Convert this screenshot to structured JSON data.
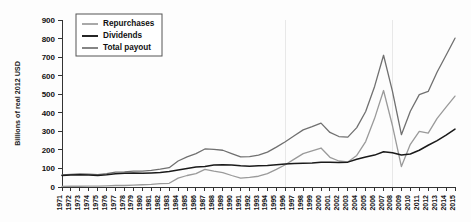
{
  "chart_data": {
    "type": "line",
    "title": "",
    "xlabel": "",
    "ylabel": "Billions of real 2012 USD",
    "ylim": [
      0,
      900
    ],
    "ytick_values": [
      0,
      100,
      200,
      300,
      400,
      500,
      600,
      700,
      800,
      900
    ],
    "ytick_labels": [
      "0",
      "100",
      "200",
      "300",
      "400",
      "500",
      "600",
      "700",
      "800",
      "900"
    ],
    "grid": false,
    "legend_position": "upper-left",
    "x": [
      1971,
      1972,
      1973,
      1974,
      1975,
      1976,
      1977,
      1978,
      1979,
      1980,
      1981,
      1982,
      1983,
      1984,
      1985,
      1986,
      1987,
      1988,
      1989,
      1990,
      1991,
      1992,
      1993,
      1994,
      1995,
      1996,
      1997,
      1998,
      1999,
      2000,
      2001,
      2002,
      2003,
      2004,
      2005,
      2006,
      2007,
      2008,
      2009,
      2010,
      2011,
      2012,
      2013,
      2014,
      2015
    ],
    "xtick_labels": [
      "1971",
      "1972",
      "1973",
      "1974",
      "1975",
      "1976",
      "1977",
      "1978",
      "1979",
      "1980",
      "1981",
      "1982",
      "1983",
      "1984",
      "1985",
      "1986",
      "1987",
      "1988",
      "1989",
      "1990",
      "1991",
      "1992",
      "1993",
      "1994",
      "1995",
      "1996",
      "1997",
      "1998",
      "1999",
      "2000",
      "2001",
      "2002",
      "2003",
      "2004",
      "2005",
      "2006",
      "2007",
      "2008",
      "2009",
      "2010",
      "2011",
      "2012",
      "2013",
      "2014",
      "2015"
    ],
    "series": [
      {
        "name": "Repurchases",
        "color": "#9a9a9a",
        "width": 1.3,
        "values": [
          3,
          4,
          4,
          5,
          5,
          6,
          8,
          8,
          10,
          12,
          14,
          18,
          20,
          48,
          62,
          72,
          95,
          85,
          78,
          62,
          48,
          52,
          58,
          72,
          95,
          120,
          150,
          180,
          195,
          210,
          160,
          140,
          135,
          170,
          245,
          370,
          520,
          330,
          110,
          230,
          300,
          290,
          370,
          430,
          490
        ]
      },
      {
        "name": "Dividends",
        "color": "#1a1a1a",
        "width": 1.5,
        "values": [
          62,
          64,
          66,
          64,
          62,
          66,
          72,
          74,
          76,
          74,
          76,
          78,
          84,
          92,
          100,
          108,
          110,
          118,
          120,
          118,
          114,
          112,
          114,
          116,
          120,
          124,
          126,
          128,
          130,
          134,
          134,
          132,
          134,
          150,
          162,
          172,
          190,
          185,
          172,
          178,
          198,
          225,
          250,
          280,
          312
        ]
      },
      {
        "name": "Total payout",
        "color": "#707070",
        "width": 1.3,
        "values": [
          65,
          68,
          70,
          69,
          67,
          72,
          80,
          82,
          86,
          86,
          90,
          96,
          104,
          140,
          162,
          180,
          205,
          203,
          198,
          180,
          162,
          164,
          172,
          188,
          215,
          244,
          276,
          308,
          325,
          344,
          294,
          272,
          269,
          320,
          407,
          542,
          710,
          515,
          282,
          408,
          498,
          515,
          620,
          710,
          802
        ]
      }
    ]
  },
  "legend": {
    "items": [
      {
        "label": "Repurchases"
      },
      {
        "label": "Dividends"
      },
      {
        "label": "Total payout"
      }
    ]
  }
}
